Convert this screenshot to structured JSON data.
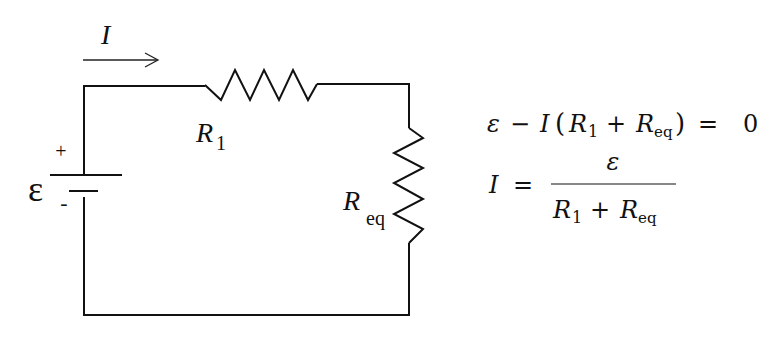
{
  "circuit": {
    "current_label": "I",
    "emf_symbol": "ε",
    "battery_positive": "+",
    "battery_negative": "-",
    "resistors": [
      {
        "id": "R1",
        "symbol": "R",
        "subscript": "1",
        "orientation": "horizontal"
      },
      {
        "id": "Req",
        "symbol": "R",
        "subscript": "eq",
        "orientation": "vertical"
      }
    ],
    "current_direction": "right"
  },
  "equations": [
    {
      "parts": {
        "emf": "ε",
        "minus": "−",
        "current": "I",
        "lparen": "(",
        "r1": "R",
        "r1_sub": "1",
        "plus": "+",
        "req": "R",
        "req_sub": "eq",
        "rparen": ")",
        "equals": "=",
        "zero": "0"
      },
      "text": "ε − I(R1 + Req) = 0"
    },
    {
      "parts": {
        "current": "I",
        "equals": "=",
        "numerator": "ε",
        "den_r1": "R",
        "den_r1_sub": "1",
        "den_plus": "+",
        "den_req": "R",
        "den_req_sub": "eq"
      },
      "text": "I = ε / (R1 + Req)"
    }
  ]
}
